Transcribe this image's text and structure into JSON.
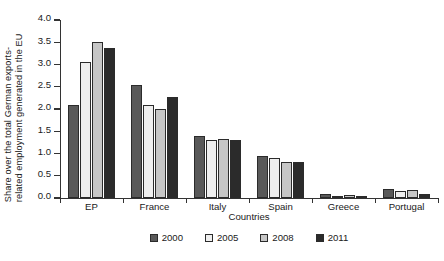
{
  "chart_data": {
    "type": "bar",
    "title": "",
    "xlabel": "Countries",
    "ylabel": "Share over the total German exports-related employment generated in the EU",
    "ylabel_lines": [
      "Share over the total German exports-",
      "related employment generated in the EU"
    ],
    "categories": [
      "EP",
      "France",
      "Italy",
      "Spain",
      "Greece",
      "Portugal"
    ],
    "series": [
      {
        "name": "2000",
        "color": "#595959",
        "values": [
          2.08,
          2.53,
          1.4,
          0.95,
          0.08,
          0.2
        ]
      },
      {
        "name": "2005",
        "color": "#efefef",
        "values": [
          3.05,
          2.09,
          1.3,
          0.89,
          0.04,
          0.16
        ]
      },
      {
        "name": "2008",
        "color": "#c6c6c6",
        "values": [
          3.5,
          2.0,
          1.32,
          0.8,
          0.07,
          0.17
        ]
      },
      {
        "name": "2011",
        "color": "#2b2b2b",
        "values": [
          3.37,
          2.26,
          1.3,
          0.82,
          0.03,
          0.1
        ]
      }
    ],
    "ylim": [
      0.0,
      4.0
    ],
    "yticks": [
      "0.0",
      "0.5",
      "1.0",
      "1.5",
      "2.0",
      "2.5",
      "3.0",
      "3.5",
      "4.0"
    ],
    "ytick_values": [
      0.0,
      0.5,
      1.0,
      1.5,
      2.0,
      2.5,
      3.0,
      3.5,
      4.0
    ],
    "grid": false,
    "legend_position": "bottom-center"
  }
}
